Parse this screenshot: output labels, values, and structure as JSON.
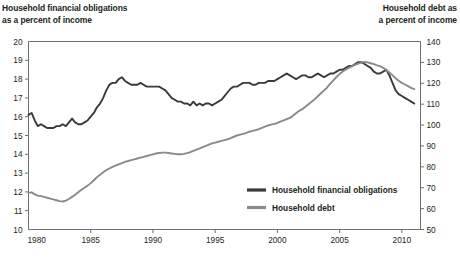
{
  "titles": {
    "left": "Household financial obligations\nas a percent of income",
    "right": "Household debt as\na percent of income"
  },
  "legend": {
    "items": [
      {
        "label": "Household financial obligations",
        "color": "#3a3a3a"
      },
      {
        "label": "Household debt",
        "color": "#8a8a8a"
      }
    ]
  },
  "chart_data": {
    "type": "line",
    "title": "",
    "xlabel": "",
    "grid": false,
    "legend_position": "inside-center-right",
    "xlim": [
      1980,
      2011.5
    ],
    "xticks": [
      1980,
      1985,
      1990,
      1995,
      2000,
      2005,
      2010
    ],
    "xticklabels": [
      "1980",
      "1985",
      "1990",
      "1995",
      "2000",
      "2005",
      "2010"
    ],
    "left_axis": {
      "label": "Household financial obligations as a percent of income",
      "ylim": [
        10,
        20
      ],
      "yticks": [
        10,
        11,
        12,
        13,
        14,
        15,
        16,
        17,
        18,
        19,
        20
      ],
      "yticklabels": [
        "10",
        "11",
        "12",
        "13",
        "14",
        "15",
        "16",
        "17",
        "18",
        "19",
        "20"
      ]
    },
    "right_axis": {
      "label": "Household debt as a percent of income",
      "ylim": [
        50,
        140
      ],
      "yticks": [
        50,
        60,
        70,
        80,
        90,
        100,
        110,
        120,
        130,
        140
      ],
      "yticklabels": [
        "50",
        "60",
        "70",
        "80",
        "90",
        "100",
        "110",
        "120",
        "130",
        "140"
      ]
    },
    "series": [
      {
        "name": "Household financial obligations",
        "color": "#3a3a3a",
        "axis": "left",
        "units": "percent of income",
        "x": [
          1980.0,
          1980.25,
          1980.5,
          1980.75,
          1981.0,
          1981.25,
          1981.5,
          1981.75,
          1982.0,
          1982.25,
          1982.5,
          1982.75,
          1983.0,
          1983.25,
          1983.5,
          1983.75,
          1984.0,
          1984.25,
          1984.5,
          1984.75,
          1985.0,
          1985.25,
          1985.5,
          1985.75,
          1986.0,
          1986.25,
          1986.5,
          1986.75,
          1987.0,
          1987.25,
          1987.5,
          1987.75,
          1988.0,
          1988.25,
          1988.5,
          1988.75,
          1989.0,
          1989.25,
          1989.5,
          1989.75,
          1990.0,
          1990.25,
          1990.5,
          1990.75,
          1991.0,
          1991.25,
          1991.5,
          1991.75,
          1992.0,
          1992.25,
          1992.5,
          1992.75,
          1993.0,
          1993.25,
          1993.5,
          1993.75,
          1994.0,
          1994.25,
          1994.5,
          1994.75,
          1995.0,
          1995.25,
          1995.5,
          1995.75,
          1996.0,
          1996.25,
          1996.5,
          1996.75,
          1997.0,
          1997.25,
          1997.5,
          1997.75,
          1998.0,
          1998.25,
          1998.5,
          1998.75,
          1999.0,
          1999.25,
          1999.5,
          1999.75,
          2000.0,
          2000.25,
          2000.5,
          2000.75,
          2001.0,
          2001.25,
          2001.5,
          2001.75,
          2002.0,
          2002.25,
          2002.5,
          2002.75,
          2003.0,
          2003.25,
          2003.5,
          2003.75,
          2004.0,
          2004.25,
          2004.5,
          2004.75,
          2005.0,
          2005.25,
          2005.5,
          2005.75,
          2006.0,
          2006.25,
          2006.5,
          2006.75,
          2007.0,
          2007.25,
          2007.5,
          2007.75,
          2008.0,
          2008.25,
          2008.5,
          2008.75,
          2009.0,
          2009.25,
          2009.5,
          2009.75,
          2010.0,
          2010.25,
          2010.5,
          2010.75,
          2011.0
        ],
        "y": [
          16.1,
          16.2,
          15.8,
          15.5,
          15.6,
          15.5,
          15.4,
          15.4,
          15.4,
          15.5,
          15.5,
          15.6,
          15.5,
          15.7,
          15.9,
          15.7,
          15.6,
          15.6,
          15.7,
          15.8,
          16.0,
          16.2,
          16.5,
          16.7,
          17.0,
          17.4,
          17.7,
          17.8,
          17.8,
          18.0,
          18.1,
          17.9,
          17.8,
          17.7,
          17.7,
          17.7,
          17.8,
          17.7,
          17.6,
          17.6,
          17.6,
          17.6,
          17.6,
          17.5,
          17.4,
          17.2,
          17.0,
          16.9,
          16.8,
          16.8,
          16.7,
          16.7,
          16.6,
          16.8,
          16.6,
          16.7,
          16.6,
          16.7,
          16.7,
          16.6,
          16.7,
          16.8,
          16.9,
          17.1,
          17.3,
          17.5,
          17.6,
          17.6,
          17.7,
          17.8,
          17.8,
          17.8,
          17.7,
          17.7,
          17.8,
          17.8,
          17.8,
          17.9,
          17.9,
          17.9,
          18.0,
          18.1,
          18.2,
          18.3,
          18.2,
          18.1,
          18.0,
          18.1,
          18.2,
          18.2,
          18.1,
          18.1,
          18.2,
          18.3,
          18.2,
          18.1,
          18.2,
          18.3,
          18.3,
          18.4,
          18.5,
          18.5,
          18.6,
          18.7,
          18.7,
          18.8,
          18.9,
          18.9,
          18.8,
          18.7,
          18.6,
          18.4,
          18.3,
          18.3,
          18.4,
          18.5,
          18.2,
          17.8,
          17.4,
          17.2,
          17.1,
          17.0,
          16.9,
          16.8,
          16.7
        ]
      },
      {
        "name": "Household debt",
        "color": "#8a8a8a",
        "axis": "right",
        "units": "percent of income",
        "x": [
          1980.0,
          1980.25,
          1980.5,
          1980.75,
          1981.0,
          1981.25,
          1981.5,
          1981.75,
          1982.0,
          1982.25,
          1982.5,
          1982.75,
          1983.0,
          1983.25,
          1983.5,
          1983.75,
          1984.0,
          1984.25,
          1984.5,
          1984.75,
          1985.0,
          1985.25,
          1985.5,
          1985.75,
          1986.0,
          1986.25,
          1986.5,
          1986.75,
          1987.0,
          1987.25,
          1987.5,
          1987.75,
          1988.0,
          1988.25,
          1988.5,
          1988.75,
          1989.0,
          1989.25,
          1989.5,
          1989.75,
          1990.0,
          1990.25,
          1990.5,
          1990.75,
          1991.0,
          1991.25,
          1991.5,
          1991.75,
          1992.0,
          1992.25,
          1992.5,
          1992.75,
          1993.0,
          1993.25,
          1993.5,
          1993.75,
          1994.0,
          1994.25,
          1994.5,
          1994.75,
          1995.0,
          1995.25,
          1995.5,
          1995.75,
          1996.0,
          1996.25,
          1996.5,
          1996.75,
          1997.0,
          1997.25,
          1997.5,
          1997.75,
          1998.0,
          1998.25,
          1998.5,
          1998.75,
          1999.0,
          1999.25,
          1999.5,
          1999.75,
          2000.0,
          2000.25,
          2000.5,
          2000.75,
          2001.0,
          2001.25,
          2001.5,
          2001.75,
          2002.0,
          2002.25,
          2002.5,
          2002.75,
          2003.0,
          2003.25,
          2003.5,
          2003.75,
          2004.0,
          2004.25,
          2004.5,
          2004.75,
          2005.0,
          2005.25,
          2005.5,
          2005.75,
          2006.0,
          2006.25,
          2006.5,
          2006.75,
          2007.0,
          2007.25,
          2007.5,
          2007.75,
          2008.0,
          2008.25,
          2008.5,
          2008.75,
          2009.0,
          2009.25,
          2009.5,
          2009.75,
          2010.0,
          2010.25,
          2010.5,
          2010.75,
          2011.0
        ],
        "y": [
          67.5,
          67.8,
          66.8,
          66.2,
          66.0,
          65.6,
          65.2,
          64.8,
          64.4,
          64.0,
          63.6,
          63.4,
          63.8,
          64.6,
          65.6,
          66.6,
          67.8,
          69.0,
          70.0,
          71.0,
          72.2,
          73.6,
          75.0,
          76.2,
          77.4,
          78.4,
          79.2,
          80.0,
          80.6,
          81.2,
          81.8,
          82.4,
          82.8,
          83.2,
          83.6,
          84.0,
          84.4,
          84.8,
          85.2,
          85.6,
          86.0,
          86.4,
          86.6,
          86.8,
          86.8,
          86.6,
          86.4,
          86.2,
          86.0,
          86.0,
          86.2,
          86.6,
          87.0,
          87.6,
          88.2,
          88.8,
          89.4,
          90.0,
          90.6,
          91.2,
          91.6,
          92.0,
          92.4,
          92.8,
          93.2,
          93.8,
          94.4,
          95.0,
          95.4,
          95.8,
          96.2,
          96.8,
          97.2,
          97.6,
          98.0,
          98.6,
          99.2,
          99.8,
          100.2,
          100.6,
          101.0,
          101.6,
          102.2,
          102.8,
          103.4,
          104.4,
          105.6,
          106.8,
          107.6,
          108.8,
          110.0,
          111.2,
          112.4,
          113.8,
          115.2,
          116.6,
          118.0,
          119.8,
          121.4,
          123.0,
          124.4,
          125.6,
          126.6,
          127.4,
          128.2,
          128.8,
          129.4,
          130.0,
          130.2,
          130.0,
          129.6,
          129.2,
          128.6,
          128.2,
          127.4,
          126.4,
          125.2,
          123.8,
          122.4,
          121.2,
          120.2,
          119.4,
          118.6,
          117.8,
          117.2
        ]
      }
    ]
  }
}
